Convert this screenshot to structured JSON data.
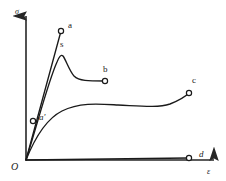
{
  "figure": {
    "type": "stress-strain-diagram",
    "title": "",
    "background_color": "#ffffff",
    "line_color": "#1a1a1a",
    "axis_color": "#262626"
  },
  "axes": {
    "y_label": "σ",
    "x_label": "ε",
    "origin_label": "O",
    "y_label_pos": {
      "x": 15,
      "y": 8
    },
    "x_label_pos": {
      "x": 207,
      "y": 168
    },
    "origin_label_pos": {
      "x": 11,
      "y": 162
    },
    "origin_point": {
      "x": 26,
      "y": 160
    },
    "y_axis_top": {
      "x": 26,
      "y": 14
    },
    "x_axis_right": {
      "x": 216,
      "y": 160
    },
    "arrowheads": true,
    "grid": false,
    "ticks": false
  },
  "labels": [
    {
      "name": "label-a",
      "text": "a",
      "x": 68,
      "y": 21,
      "italic": false
    },
    {
      "name": "label-s",
      "text": "s",
      "x": 60,
      "y": 40,
      "italic": false
    },
    {
      "name": "label-b",
      "text": "b",
      "x": 103,
      "y": 65,
      "italic": false
    },
    {
      "name": "label-c",
      "text": "c",
      "x": 192,
      "y": 76,
      "italic": false
    },
    {
      "name": "label-d",
      "text": "d",
      "x": 199,
      "y": 150,
      "italic": true
    },
    {
      "name": "label-a-prime",
      "text": "a′",
      "x": 39,
      "y": 113,
      "italic": true
    }
  ],
  "chart_data": {
    "type": "line",
    "title": "",
    "xlabel": "ε",
    "ylabel": "σ",
    "xlim": [
      0,
      216
    ],
    "ylim": [
      0,
      160
    ],
    "grid": false,
    "legend": "none",
    "annotations": [
      "a",
      "s",
      "b",
      "c",
      "d",
      "a′",
      "O"
    ],
    "series": [
      {
        "name": "curve-a",
        "label": "a",
        "description": "brittle linear-elastic response rising steeply to fracture at point a",
        "path": "M 26 160 L 61 31",
        "endpoint": {
          "x": 61,
          "y": 31,
          "marker": "open-circle"
        },
        "marker_radius": 2.6
      },
      {
        "name": "curve-s-b",
        "label": "b",
        "description": "elastic rise to upper yield peak s, drop then flat plateau ending at point b",
        "path": "M 26 160 C 38 122 48 82 57 62 C 59 57 61 54 63 56 C 66 60 69 70 74 76 C 79 81 88 81 105 81",
        "peak": {
          "name": "s",
          "x": 63,
          "y": 55
        },
        "endpoint": {
          "x": 105,
          "y": 81,
          "marker": "open-circle"
        },
        "marker_radius": 2.6
      },
      {
        "name": "curve-c",
        "label": "c",
        "description": "ductile response: steep rise, long plateau, then strain-hardening up to point c",
        "path": "M 26 160 C 34 140 46 119 62 111 C 80 102 100 104 118 105 C 140 106 158 108 170 104 C 180 100 186 96 189 93",
        "endpoint": {
          "x": 189,
          "y": 93,
          "marker": "open-circle"
        },
        "marker_radius": 2.6
      },
      {
        "name": "curve-d",
        "label": "d",
        "description": "flat near-zero stress response along the strain axis ending at point d",
        "path": "M 26 160 L 188 158",
        "endpoint": {
          "x": 189,
          "y": 158,
          "marker": "open-circle"
        },
        "marker_radius": 2.6
      }
    ],
    "points": [
      {
        "name": "a",
        "x": 61,
        "y": 31,
        "marker": "open-circle"
      },
      {
        "name": "a′",
        "x": 33,
        "y": 121,
        "marker": "open-circle"
      },
      {
        "name": "b",
        "x": 105,
        "y": 81,
        "marker": "open-circle"
      },
      {
        "name": "c",
        "x": 189,
        "y": 93,
        "marker": "open-circle"
      },
      {
        "name": "d",
        "x": 189,
        "y": 158,
        "marker": "open-circle"
      }
    ]
  }
}
